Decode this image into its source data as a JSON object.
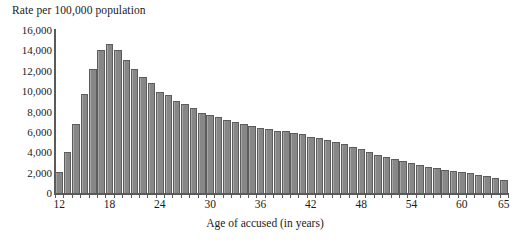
{
  "chart_data": {
    "type": "bar",
    "title": "",
    "ylabel": "Rate per 100,000 population",
    "xlabel": "Age of accused (in years)",
    "ylim": [
      0,
      16000
    ],
    "ytick_labels": [
      "16,000",
      "14,000",
      "12,000",
      "10,000",
      "8,000",
      "6,000",
      "4,000",
      "2,000",
      "0"
    ],
    "ytick_values": [
      16000,
      14000,
      12000,
      10000,
      8000,
      6000,
      4000,
      2000,
      0
    ],
    "xtick_labels": [
      "12",
      "18",
      "24",
      "30",
      "36",
      "42",
      "48",
      "54",
      "60",
      "65"
    ],
    "xtick_values": [
      12,
      18,
      24,
      30,
      36,
      42,
      48,
      54,
      60,
      65
    ],
    "xlim": [
      11.5,
      65.5
    ],
    "grid": false,
    "legend": "none",
    "bar_color": "#8d8d8d",
    "bar_edge_color": "#5d5d5d",
    "categories": [
      12,
      13,
      14,
      15,
      16,
      17,
      18,
      19,
      20,
      21,
      22,
      23,
      24,
      25,
      26,
      27,
      28,
      29,
      30,
      31,
      32,
      33,
      34,
      35,
      36,
      37,
      38,
      39,
      40,
      41,
      42,
      43,
      44,
      45,
      46,
      47,
      48,
      49,
      50,
      51,
      52,
      53,
      54,
      55,
      56,
      57,
      58,
      59,
      60,
      61,
      62,
      63,
      64,
      65
    ],
    "values": [
      2100,
      4000,
      6800,
      9700,
      12200,
      14000,
      14600,
      14000,
      13100,
      12200,
      11400,
      10800,
      9950,
      9600,
      9050,
      8750,
      8350,
      7900,
      7700,
      7500,
      7200,
      6950,
      6800,
      6600,
      6400,
      6300,
      6050,
      6050,
      5900,
      5750,
      5500,
      5400,
      5250,
      5050,
      4800,
      4500,
      4300,
      4000,
      3750,
      3500,
      3300,
      3100,
      2900,
      2750,
      2600,
      2450,
      2300,
      2200,
      2050,
      1950,
      1800,
      1650,
      1500,
      1300
    ]
  }
}
